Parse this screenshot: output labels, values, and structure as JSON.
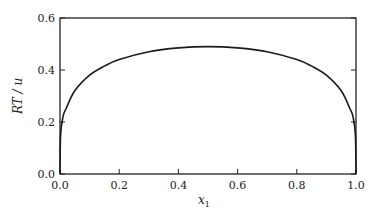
{
  "chart_data": {
    "type": "line",
    "title": "",
    "xlabel": "x",
    "xlabel_subscript": "1",
    "ylabel": "RT / u",
    "xlim": [
      0.0,
      1.0
    ],
    "ylim": [
      0.0,
      0.6
    ],
    "grid": false,
    "legend": null,
    "x_ticks": [
      "0.0",
      "0.2",
      "0.4",
      "0.6",
      "0.8",
      "1.0"
    ],
    "y_ticks": [
      "0.0",
      "0.2",
      "0.4",
      "0.6"
    ],
    "series": [
      {
        "name": "RT/u",
        "x": [
          0.0,
          0.002,
          0.01,
          0.02,
          0.05,
          0.1,
          0.15,
          0.2,
          0.3,
          0.4,
          0.5,
          0.6,
          0.7,
          0.8,
          0.85,
          0.9,
          0.95,
          0.98,
          0.99,
          0.998,
          1.0
        ],
        "y": [
          0.0,
          0.15,
          0.22,
          0.25,
          0.32,
          0.38,
          0.415,
          0.44,
          0.47,
          0.485,
          0.49,
          0.485,
          0.47,
          0.44,
          0.415,
          0.38,
          0.32,
          0.25,
          0.22,
          0.15,
          0.0
        ]
      }
    ]
  }
}
